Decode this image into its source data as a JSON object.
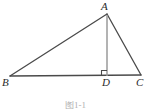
{
  "figure": {
    "caption": "图1-1",
    "background_color": "#ffffff",
    "stroke_color": "#4a4a4a",
    "altitude_color": "#9a9a9a",
    "label_color": "#2b2b2b"
  },
  "labels": {
    "A": "A",
    "B": "B",
    "C": "C",
    "D": "D"
  },
  "geometry": {
    "type": "triangle-with-altitude",
    "points": {
      "A": {
        "x": 107,
        "y": 14
      },
      "B": {
        "x": 10,
        "y": 76
      },
      "C": {
        "x": 141,
        "y": 75
      },
      "D": {
        "x": 107,
        "y": 76
      }
    },
    "segments": [
      {
        "name": "AB",
        "from": "A",
        "to": "B",
        "style": "solid"
      },
      {
        "name": "AC",
        "from": "A",
        "to": "C",
        "style": "solid"
      },
      {
        "name": "BC",
        "from": "B",
        "to": "C",
        "style": "solid"
      },
      {
        "name": "AD",
        "from": "A",
        "to": "D",
        "style": "solid-light"
      }
    ],
    "right_angle": {
      "at": "D",
      "between": [
        "AD",
        "DB"
      ],
      "marker_size": 5,
      "side": "left"
    }
  }
}
